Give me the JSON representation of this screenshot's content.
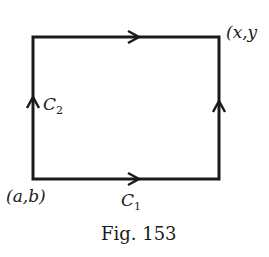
{
  "figure": {
    "caption": "Fig. 153",
    "labels": {
      "start_point": "(a,b)",
      "end_point": "(x,y",
      "path_c1": "C",
      "path_c1_sub": "1",
      "path_c2": "C",
      "path_c2_sub": "2"
    },
    "colors": {
      "stroke": "#1a1a1a",
      "background": "#ffffff"
    }
  }
}
